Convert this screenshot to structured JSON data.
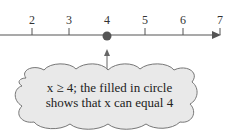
{
  "number_line": {
    "ticks": [
      {
        "label": "2",
        "x": 32
      },
      {
        "label": "3",
        "x": 69
      },
      {
        "label": "4",
        "x": 107
      },
      {
        "label": "5",
        "x": 145
      },
      {
        "label": "6",
        "x": 183
      },
      {
        "label": "7",
        "x": 220
      }
    ],
    "filled_point": "4",
    "direction": "right",
    "color": "#555555"
  },
  "callout": {
    "line1": "x ≥ 4; the filled in circle",
    "line2": "shows that x can equal 4",
    "fill": "#e9e9e9"
  }
}
